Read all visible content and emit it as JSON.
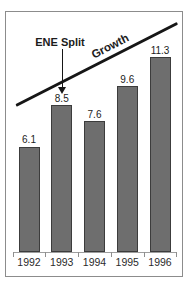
{
  "chart_data": {
    "type": "bar",
    "title": "",
    "xlabel": "",
    "ylabel": "",
    "categories": [
      "1992",
      "1993",
      "1994",
      "1995",
      "1996"
    ],
    "values": [
      6.1,
      8.5,
      7.6,
      9.6,
      11.3
    ],
    "bar_value_labels": [
      "6.1",
      "8.5",
      "7.6",
      "9.6",
      "11.3"
    ],
    "ylim": [
      0,
      13
    ],
    "grid": false,
    "legend": false,
    "annotations": {
      "event_label": "ENE Split",
      "event_arrow_target_category": "1993",
      "trend_label": "Growth",
      "trend_line": {
        "from_category": "1992",
        "to_category": "1996",
        "direction": "rising"
      }
    },
    "colors": {
      "bar_fill": "#6e6e6e",
      "bar_border": "#3c3c3c",
      "line": "#161616",
      "text": "#1c1c1c",
      "axis": "#9e9e9e",
      "frame_border": "#8c8c8c",
      "background": "#ffffff"
    }
  }
}
